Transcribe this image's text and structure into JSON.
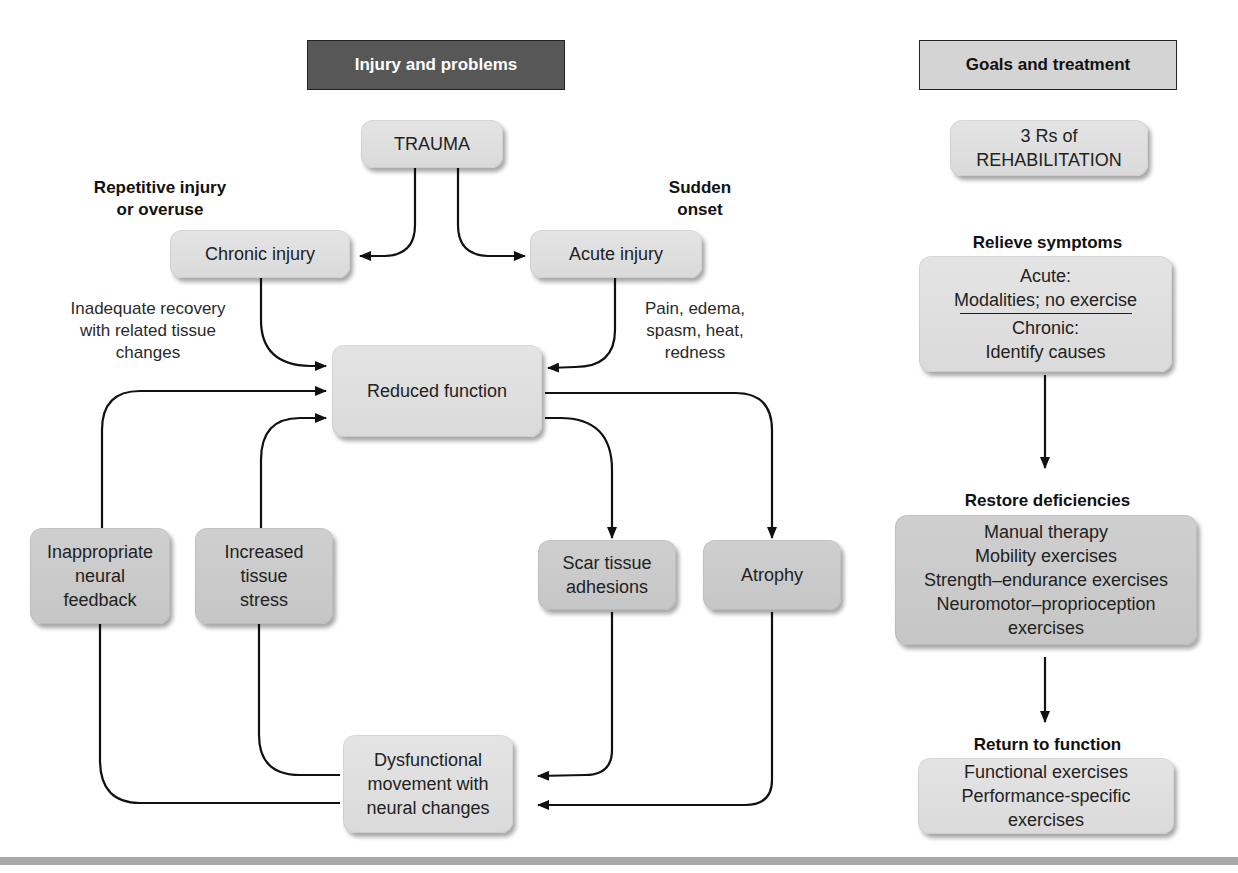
{
  "left_panel": {
    "header": "Injury and problems",
    "nodes": {
      "trauma": "TRAUMA",
      "chronic_injury": "Chronic injury",
      "acute_injury": "Acute injury",
      "reduced_function": "Reduced function",
      "inappropriate_neural_feedback": [
        "Inappropriate",
        "neural",
        "feedback"
      ],
      "increased_tissue_stress": [
        "Increased",
        "tissue",
        "stress"
      ],
      "scar_tissue_adhesions": [
        "Scar tissue",
        "adhesions"
      ],
      "atrophy": "Atrophy",
      "dysfunctional_movement": [
        "Dysfunctional",
        "movement with",
        "neural changes"
      ]
    },
    "labels": {
      "repetitive": [
        "Repetitive injury",
        "or overuse"
      ],
      "sudden": [
        "Sudden",
        "onset"
      ],
      "chronic_note": [
        "Inadequate recovery",
        "with related tissue",
        "changes"
      ],
      "acute_note": [
        "Pain, edema,",
        "spasm, heat,",
        "redness"
      ]
    }
  },
  "right_panel": {
    "header": "Goals and treatment",
    "title_box": [
      "3 Rs of",
      "REHABILITATION"
    ],
    "steps": [
      {
        "heading": "Relieve symptoms",
        "acute": [
          "Acute:",
          "Modalities; no exercise"
        ],
        "chronic": [
          "Chronic:",
          "Identify causes"
        ]
      },
      {
        "heading": "Restore deficiencies",
        "items": [
          "Manual therapy",
          "Mobility exercises",
          "Strength–endurance exercises",
          "Neuromotor–proprioception",
          "exercises"
        ]
      },
      {
        "heading": "Return to function",
        "items": [
          "Functional exercises",
          "Performance-specific",
          "exercises"
        ]
      }
    ]
  },
  "colors": {
    "dark_header": "#575757",
    "light_header": "#d4d4d4",
    "box": "#dcdcdc",
    "box_dark": "#c9c9c9",
    "rule": "#a9a9a9"
  }
}
